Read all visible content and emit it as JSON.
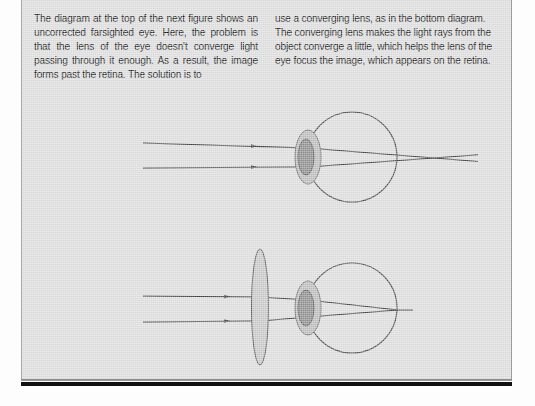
{
  "page": {
    "background_color": "#ffffff",
    "panel_color": "#dedede",
    "rule_color": "#111111"
  },
  "body_text": {
    "left_column": "The diagram at the top of the next figure shows an uncorrected farsighted eye. Here, the problem is that the lens of the eye doesn't converge light passing through it enough. As a result, the image forms past the retina. The solution is to",
    "right_column": "use a converging lens, as in the bottom diagram. The converging lens makes the light rays from the object converge a little, which helps the lens of the eye focus the image, which appears on the retina."
  },
  "figure": {
    "caption": "",
    "stroke_color": "#3a3a3a",
    "cornea_fill": "#bdbdbd",
    "lens_fill": "#8f8f8f",
    "corrective_lens_fill": "#c7c7c7",
    "diagrams": [
      {
        "name": "uncorrected-farsighted-eye",
        "label": "Top diagram: uncorrected farsighted eye",
        "has_corrective_lens": false,
        "focus_location": "past the retina",
        "eyeball": {
          "cx": 330,
          "cy": 157,
          "r": 45
        },
        "cornea": {
          "cx": 286,
          "cy": 157,
          "rx": 13,
          "ry": 27
        },
        "eye_lens": {
          "cx": 284,
          "cy": 157,
          "rx": 8,
          "ry": 18
        },
        "rays": [
          {
            "y_start": 143,
            "x_start": 121,
            "arrow_x": 232,
            "y_at_lens": 148,
            "focus_x": 412,
            "focus_y": 158
          },
          {
            "y_start": 168,
            "x_start": 121,
            "arrow_x": 232,
            "y_at_lens": 167,
            "focus_x": 412,
            "focus_y": 158
          }
        ],
        "focus_point": {
          "x": 412,
          "y": 158
        },
        "ray_tail_x": 455
      },
      {
        "name": "corrected-farsighted-eye",
        "label": "Bottom diagram: farsighted eye corrected by converging lens",
        "has_corrective_lens": true,
        "focus_location": "on the retina",
        "corrective_lens": {
          "cx": 238,
          "cy": 307,
          "rx": 8.5,
          "ry": 58
        },
        "eyeball": {
          "cx": 330,
          "cy": 308,
          "r": 45
        },
        "cornea": {
          "cx": 286,
          "cy": 308,
          "rx": 13,
          "ry": 27
        },
        "eye_lens": {
          "cx": 284,
          "cy": 308,
          "rx": 8,
          "ry": 18
        },
        "rays": [
          {
            "y_start": 296,
            "x_start": 121,
            "arrow_x": 205,
            "y_at_corrective": 297,
            "y_at_lens": 300,
            "focus_x": 376,
            "focus_y": 310
          },
          {
            "y_start": 322,
            "x_start": 121,
            "arrow_x": 205,
            "y_at_corrective": 321,
            "y_at_lens": 317,
            "focus_x": 376,
            "focus_y": 310
          }
        ],
        "focus_point": {
          "x": 376,
          "y": 310
        },
        "ray_tail_x": 390
      }
    ]
  }
}
